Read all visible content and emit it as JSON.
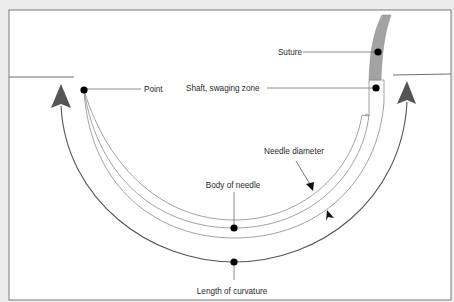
{
  "diagram": {
    "colors": {
      "background": "#ececec",
      "panel": "#ffffff",
      "border": "#7a7a7a",
      "line": "#6e6e6e",
      "needle_line": "#8a8a8a",
      "arrow": "#555555",
      "suture": "#a3a3a3",
      "dot": "#000000",
      "text": "#2a2a2a"
    },
    "labels": {
      "suture": "Suture",
      "shaft": "Shaft, swaging zone",
      "point": "Point",
      "needle_diameter": "Needle diameter",
      "body": "Body of needle",
      "length": "Length of curvature"
    }
  }
}
